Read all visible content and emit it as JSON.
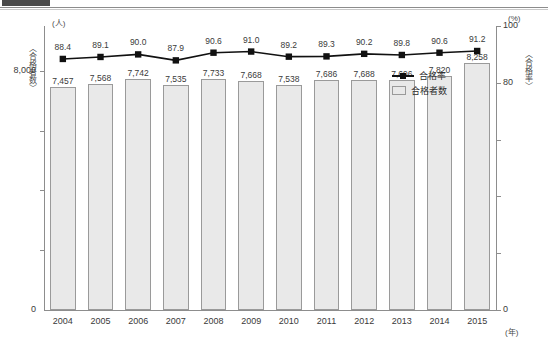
{
  "decor": {
    "corner_tab": "",
    "rule": ""
  },
  "axes": {
    "left_unit": "(人)",
    "left_title": "〈合格者数〉",
    "right_unit": "(%)",
    "right_title": "〈合格率〉",
    "x_unit": "(年)",
    "left_ticks": [
      "8,000"
    ],
    "left_zero": "0",
    "right_ticks": [
      "100",
      "80"
    ],
    "right_zero": "0"
  },
  "legend": {
    "line_label": "合格率",
    "bar_label": "合格者数",
    "line_icon": "line-marker-icon",
    "bar_icon": "bar-swatch-icon"
  },
  "chart_data": {
    "type": "bar",
    "title": "",
    "xlabel": "(年)",
    "ylabel": "〈合格者数〉(人)",
    "y2label": "〈合格率〉(%)",
    "grid": false,
    "legend_position": "inside-right",
    "categories": [
      "2004",
      "2005",
      "2006",
      "2007",
      "2008",
      "2009",
      "2010",
      "2011",
      "2012",
      "2013",
      "2014",
      "2015"
    ],
    "series": [
      {
        "name": "合格者数",
        "type": "bar",
        "axis": "left",
        "unit": "人",
        "values": [
          7457,
          7568,
          7742,
          7535,
          7733,
          7668,
          7538,
          7686,
          7688,
          7696,
          7820,
          8258
        ],
        "labels": [
          "7,457",
          "7,568",
          "7,742",
          "7,535",
          "7,733",
          "7,668",
          "7,538",
          "7,686",
          "7,688",
          "7,696",
          "7,820",
          "8,258"
        ]
      },
      {
        "name": "合格率",
        "type": "line",
        "axis": "right",
        "unit": "%",
        "values": [
          88.4,
          89.1,
          90.0,
          87.9,
          90.6,
          91.0,
          89.2,
          89.3,
          90.2,
          89.8,
          90.6,
          91.2
        ],
        "labels": [
          "88.4",
          "89.1",
          "90.0",
          "87.9",
          "90.6",
          "91.0",
          "89.2",
          "89.3",
          "90.2",
          "89.8",
          "90.6",
          "91.2"
        ]
      }
    ],
    "ylim": [
      0,
      9500
    ],
    "y2lim": [
      0,
      100
    ],
    "y_ticks": [
      0,
      8000
    ],
    "y2_ticks": [
      0,
      20,
      40,
      60,
      80,
      100
    ]
  }
}
